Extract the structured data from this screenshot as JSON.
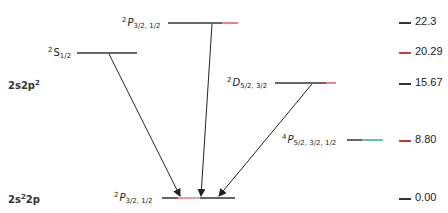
{
  "diagram": {
    "type": "energy-level-diagram",
    "configurations": [
      {
        "label_main": "2s2p",
        "label_sup": "2",
        "display": "2s2p²"
      },
      {
        "label_main_a": "2s",
        "label_sup_a": "2",
        "label_main_b": "2p",
        "display": "2s²2p"
      }
    ],
    "levels": [
      {
        "term_sup": "2",
        "term_letter": "P",
        "term_sub": "3/2, 1/2",
        "energy": "22.3",
        "tick_color": "#333333",
        "line_accent": "#e05a6a"
      },
      {
        "term_sup": "2",
        "term_letter": "S",
        "term_sub": "1/2",
        "energy": "20.29",
        "tick_color": "#d9363e"
      },
      {
        "term_sup": "2",
        "term_letter": "D",
        "term_sub": "5/2, 3/2",
        "energy": "15.67",
        "tick_color": "#333333",
        "line_accent": "#e05a6a"
      },
      {
        "term_sup": "4",
        "term_letter": "P",
        "term_sub": "5/2, 3/2, 1/2",
        "energy": "8.80",
        "tick_color": "#c0392b",
        "line_accent": "#3aa8a0"
      },
      {
        "term_sup": "2",
        "term_letter": "P",
        "term_sub": "3/2, 1/2",
        "energy": "0.00",
        "tick_color": "#333333",
        "line_accent": "#e05a6a"
      }
    ],
    "transitions": [
      {
        "from": "2P3/2,1/2 (22.3)",
        "to": "2P3/2,1/2 (0.00)"
      },
      {
        "from": "2S1/2 (20.29)",
        "to": "2P3/2,1/2 (0.00)"
      },
      {
        "from": "2D5/2,3/2 (15.67)",
        "to": "2P3/2,1/2 (0.00)"
      }
    ]
  }
}
